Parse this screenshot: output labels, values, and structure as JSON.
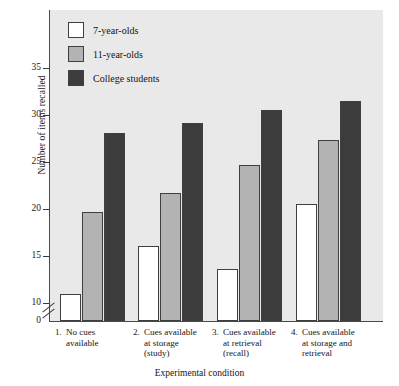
{
  "chart_data": {
    "type": "bar",
    "title": "",
    "xlabel": "Experimental condition",
    "ylabel": "Number of items recalled",
    "categories": [
      "1. No cues available",
      "2. Cues available at storage (study)",
      "3. Cues available at retrieval (recall)",
      "4. Cues available at storage and retrieval"
    ],
    "series": [
      {
        "name": "7-year-olds",
        "color": "#ffffff",
        "values": [
          11.0,
          16.0,
          13.6,
          20.5
        ]
      },
      {
        "name": "11-year-olds",
        "color": "#b3b3b3",
        "values": [
          19.7,
          21.7,
          24.7,
          27.3
        ]
      },
      {
        "name": "College students",
        "color": "#3c3c3c",
        "values": [
          28.0,
          29.1,
          30.5,
          31.4
        ]
      }
    ],
    "ylim": [
      0,
      38
    ],
    "yticks": [
      10,
      15,
      20,
      25,
      30,
      35
    ],
    "ytick_labels": [
      "10",
      "15",
      "20",
      "25",
      "30",
      "35"
    ],
    "zero_label": "0",
    "axis_break": true,
    "grid": false,
    "legend_position": "top-left"
  },
  "axes": {
    "y_title": "Number of items recalled",
    "x_title": "Experimental condition",
    "zero_tick": "0",
    "ticks": [
      "35",
      "30",
      "25",
      "20",
      "15",
      "10"
    ]
  },
  "legend": {
    "items": [
      {
        "label": "7-year-olds"
      },
      {
        "label": "11-year-olds"
      },
      {
        "label": "College students"
      }
    ]
  },
  "xaxis": {
    "groups": [
      {
        "num": "1.",
        "lines": [
          "No cues",
          "available"
        ]
      },
      {
        "num": "2.",
        "lines": [
          "Cues available",
          "at storage",
          "(study)"
        ]
      },
      {
        "num": "3.",
        "lines": [
          "Cues available",
          "at retrieval",
          "(recall)"
        ]
      },
      {
        "num": "4.",
        "lines": [
          "Cues available",
          "at storage and",
          "retrieval"
        ]
      }
    ]
  }
}
